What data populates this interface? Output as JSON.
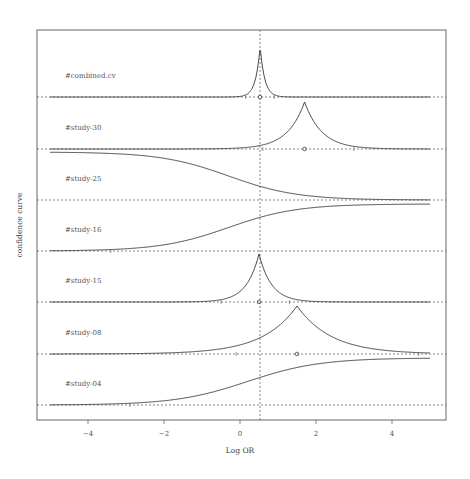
{
  "chart_data": {
    "type": "line",
    "title": "",
    "xlabel": "Log OR",
    "ylabel": "confidence curve",
    "xlim": [
      -5.3,
      5.5
    ],
    "xticks": [
      -4,
      -2,
      0,
      2,
      4
    ],
    "xtick_labels": [
      "−4",
      "−2",
      "0",
      "2",
      "4"
    ],
    "grid": false,
    "reference_line_x": 0.53,
    "series": [
      {
        "name": "#combined.cv",
        "estimate": 0.53,
        "ci": [
          0.15,
          0.9
        ],
        "shape": "narrow peak",
        "marker": 0.53
      },
      {
        "name": "#study-30",
        "estimate": 1.7,
        "ci": [
          0.6,
          3.0
        ],
        "shape": "peak",
        "marker": 1.7
      },
      {
        "name": "#study-25",
        "estimate": null,
        "shape": "decreasing from left",
        "marker": null
      },
      {
        "name": "#study-16",
        "estimate": null,
        "ci_lower": -3.4,
        "shape": "increasing to right",
        "marker": null
      },
      {
        "name": "#study-15",
        "estimate": 0.5,
        "ci": [
          -0.5,
          1.3
        ],
        "shape": "peak",
        "marker": 0.5
      },
      {
        "name": "#study-08",
        "estimate": 1.5,
        "ci": [
          -0.1,
          4.7
        ],
        "shape": "peak",
        "marker": 1.5
      },
      {
        "name": "#study-04",
        "estimate": null,
        "ci_lower": -2.9,
        "shape": "increasing to right",
        "marker": null
      }
    ]
  }
}
